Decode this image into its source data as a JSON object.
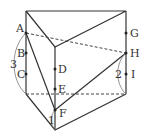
{
  "diagram": {
    "type": "triangular-prism-net",
    "points": [
      {
        "label": "A",
        "x": 26,
        "y": 33
      },
      {
        "label": "B",
        "x": 26,
        "y": 53
      },
      {
        "label": "C",
        "x": 26,
        "y": 74
      },
      {
        "label": "D",
        "x": 55,
        "y": 69
      },
      {
        "label": "E",
        "x": 55,
        "y": 89
      },
      {
        "label": "F",
        "x": 55,
        "y": 110
      },
      {
        "label": "G",
        "x": 126,
        "y": 33
      },
      {
        "label": "H",
        "x": 126,
        "y": 53
      },
      {
        "label": "I",
        "x": 126,
        "y": 74
      }
    ],
    "measurements": [
      {
        "label": "3",
        "spans": "A to bottom-left corner"
      },
      {
        "label": "2",
        "spans": "H to bottom-right corner"
      },
      {
        "label": "1",
        "spans": "F to bottom-front vertex"
      }
    ],
    "colors": {
      "line": "#333333",
      "arc": "#777777",
      "background": "#ffffff"
    }
  }
}
